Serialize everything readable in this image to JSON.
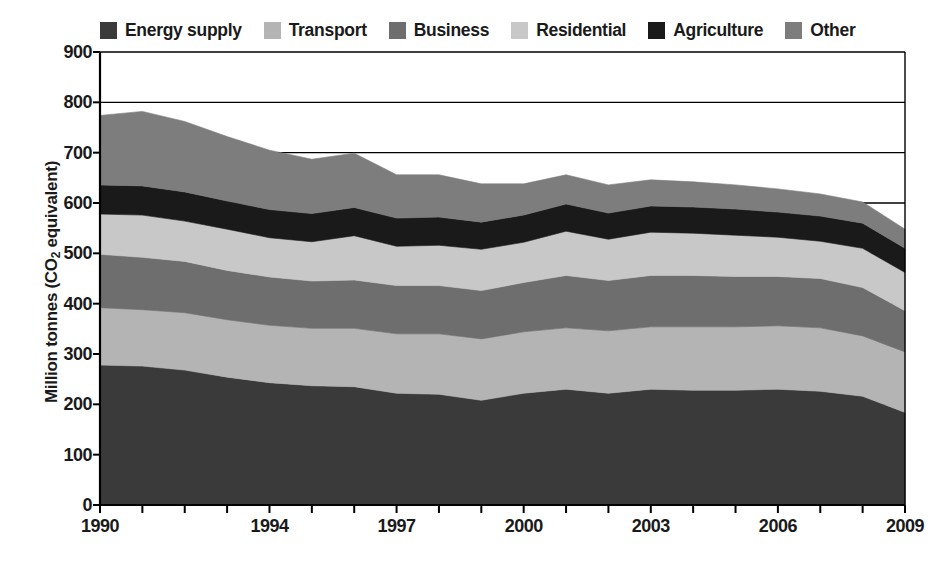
{
  "legend": {
    "items": [
      {
        "label": "Energy supply",
        "color": "#3a3a3a",
        "swatch_name": "legend-swatch-energy-supply"
      },
      {
        "label": "Transport",
        "color": "#b4b4b4",
        "swatch_name": "legend-swatch-transport"
      },
      {
        "label": "Business",
        "color": "#6e6e6e",
        "swatch_name": "legend-swatch-business"
      },
      {
        "label": "Residential",
        "color": "#c8c8c8",
        "swatch_name": "legend-swatch-residential"
      },
      {
        "label": "Agriculture",
        "color": "#1a1a1a",
        "swatch_name": "legend-swatch-agriculture"
      },
      {
        "label": "Other",
        "color": "#7d7d7d",
        "swatch_name": "legend-swatch-other"
      }
    ]
  },
  "axes": {
    "y_title_main": "Million tonnes (CO",
    "y_title_sub": "2",
    "y_title_tail": " equivalent)",
    "y_ticks": [
      "0",
      "100",
      "200",
      "300",
      "400",
      "500",
      "600",
      "700",
      "800",
      "900"
    ],
    "x_ticks": [
      "1990",
      "1994",
      "1997",
      "2000",
      "2003",
      "2006",
      "2009"
    ]
  },
  "chart_data": {
    "type": "area",
    "title": "",
    "xlabel": "",
    "ylabel": "Million tonnes (CO2 equivalent)",
    "ylim": [
      0,
      900
    ],
    "xlim": [
      1990,
      2009
    ],
    "grid": true,
    "legend_position": "top",
    "stacked": true,
    "x": [
      1990,
      1991,
      1992,
      1993,
      1994,
      1995,
      1996,
      1997,
      1998,
      1999,
      2000,
      2001,
      2002,
      2003,
      2004,
      2005,
      2006,
      2007,
      2008,
      2009
    ],
    "categories": [
      "1990",
      "1991",
      "1992",
      "1993",
      "1994",
      "1995",
      "1996",
      "1997",
      "1998",
      "1999",
      "2000",
      "2001",
      "2002",
      "2003",
      "2004",
      "2005",
      "2006",
      "2007",
      "2008",
      "2009"
    ],
    "series": [
      {
        "name": "Energy supply",
        "color": "#3a3a3a",
        "values": [
          278,
          276,
          268,
          254,
          243,
          237,
          235,
          222,
          220,
          208,
          222,
          230,
          222,
          230,
          228,
          228,
          230,
          226,
          216,
          184
        ]
      },
      {
        "name": "Transport",
        "color": "#b4b4b4",
        "values": [
          114,
          112,
          114,
          114,
          114,
          114,
          116,
          118,
          120,
          122,
          122,
          122,
          124,
          124,
          126,
          126,
          126,
          126,
          120,
          120
        ]
      },
      {
        "name": "Business",
        "color": "#6e6e6e",
        "values": [
          106,
          104,
          102,
          98,
          96,
          94,
          96,
          96,
          96,
          96,
          98,
          104,
          100,
          102,
          102,
          100,
          98,
          98,
          96,
          82
        ]
      },
      {
        "name": "Residential",
        "color": "#c8c8c8",
        "values": [
          80,
          84,
          80,
          82,
          78,
          78,
          88,
          78,
          80,
          82,
          80,
          88,
          82,
          86,
          84,
          82,
          78,
          74,
          78,
          76
        ]
      },
      {
        "name": "Agriculture",
        "color": "#1a1a1a",
        "values": [
          58,
          58,
          58,
          56,
          56,
          56,
          56,
          56,
          56,
          54,
          54,
          54,
          52,
          52,
          52,
          52,
          50,
          50,
          50,
          48
        ]
      },
      {
        "name": "Other",
        "color": "#7d7d7d",
        "values": [
          138,
          148,
          140,
          128,
          118,
          108,
          108,
          86,
          84,
          76,
          62,
          58,
          56,
          52,
          50,
          48,
          46,
          44,
          42,
          38
        ]
      }
    ],
    "totals": [
      774,
      782,
      762,
      732,
      705,
      687,
      699,
      656,
      656,
      638,
      638,
      656,
      636,
      646,
      642,
      636,
      628,
      618,
      602,
      548
    ]
  }
}
